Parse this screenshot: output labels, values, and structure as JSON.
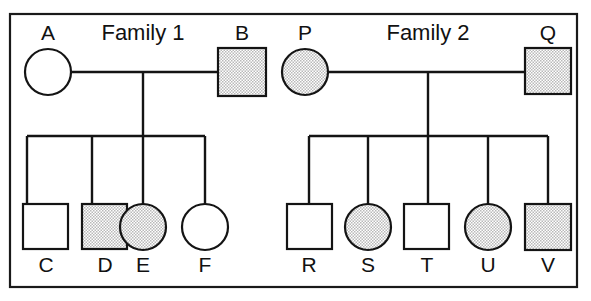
{
  "figure": {
    "name": "two-family-pedigree-chart",
    "width": 591,
    "height": 301,
    "background_color": "#ffffff",
    "line_color": "#141414",
    "affected_fill_color": "#d9d9d9",
    "unaffected_fill_color": "#ffffff",
    "frame": {
      "x": 9,
      "y": 13,
      "width": 569,
      "height": 275
    }
  },
  "legend_semantics": {
    "square": "male",
    "circle": "female",
    "shaded": "affected",
    "unshaded": "unaffected"
  },
  "families": [
    {
      "id": "family-1",
      "title": "Family 1",
      "title_x": 143,
      "title_y": 40,
      "mating_line": {
        "y": 72,
        "x1": 71,
        "x2": 218
      },
      "descent_line": {
        "x": 143,
        "y1": 72,
        "y2": 136
      },
      "sibship_line": {
        "y": 136,
        "x1": 27,
        "x2": 205
      },
      "parents": [
        {
          "label": "A",
          "shape": "circle",
          "affected": false,
          "sex": "female",
          "cx": 48,
          "cy": 72,
          "r": 23,
          "label_x": 48,
          "label_y": 40
        },
        {
          "label": "B",
          "shape": "square",
          "affected": true,
          "sex": "male",
          "x": 218,
          "y": 48,
          "size": 48,
          "label_x": 242,
          "label_y": 40
        }
      ],
      "children": [
        {
          "label": "C",
          "shape": "square",
          "affected": false,
          "sex": "male",
          "x": 23,
          "y": 204,
          "size": 45,
          "drop_x": 27,
          "label_x": 46,
          "label_y": 272
        },
        {
          "label": "D",
          "shape": "square",
          "affected": true,
          "sex": "male",
          "x": 82,
          "y": 204,
          "size": 45,
          "drop_x": 92,
          "label_x": 105,
          "label_y": 272
        },
        {
          "label": "E",
          "shape": "circle",
          "affected": true,
          "sex": "female",
          "cx": 143,
          "cy": 227,
          "r": 23,
          "drop_x": 143,
          "label_x": 143,
          "label_y": 272
        },
        {
          "label": "F",
          "shape": "circle",
          "affected": false,
          "sex": "female",
          "cx": 205,
          "cy": 227,
          "r": 23,
          "drop_x": 205,
          "label_x": 205,
          "label_y": 272
        }
      ]
    },
    {
      "id": "family-2",
      "title": "Family 2",
      "title_x": 428,
      "title_y": 40,
      "mating_line": {
        "y": 72,
        "x1": 328,
        "x2": 525
      },
      "descent_line": {
        "x": 428,
        "y1": 72,
        "y2": 136
      },
      "sibship_line": {
        "y": 136,
        "x1": 309,
        "x2": 548
      },
      "parents": [
        {
          "label": "P",
          "shape": "circle",
          "affected": true,
          "sex": "female",
          "cx": 305,
          "cy": 72,
          "r": 23,
          "label_x": 305,
          "label_y": 40
        },
        {
          "label": "Q",
          "shape": "square",
          "affected": true,
          "sex": "male",
          "x": 525,
          "y": 48,
          "size": 46,
          "label_x": 548,
          "label_y": 40
        }
      ],
      "children": [
        {
          "label": "R",
          "shape": "square",
          "affected": false,
          "sex": "male",
          "x": 287,
          "y": 204,
          "size": 45,
          "drop_x": 309,
          "label_x": 309,
          "label_y": 272
        },
        {
          "label": "S",
          "shape": "circle",
          "affected": true,
          "sex": "female",
          "cx": 368,
          "cy": 227,
          "r": 23,
          "drop_x": 368,
          "label_x": 368,
          "label_y": 272
        },
        {
          "label": "T",
          "shape": "square",
          "affected": false,
          "sex": "male",
          "x": 404,
          "y": 204,
          "size": 45,
          "drop_x": 428,
          "label_x": 427,
          "label_y": 272
        },
        {
          "label": "U",
          "shape": "circle",
          "affected": true,
          "sex": "female",
          "cx": 488,
          "cy": 227,
          "r": 23,
          "drop_x": 488,
          "label_x": 488,
          "label_y": 272
        },
        {
          "label": "V",
          "shape": "square",
          "affected": true,
          "sex": "male",
          "x": 525,
          "y": 204,
          "size": 46,
          "drop_x": 548,
          "label_x": 548,
          "label_y": 272
        }
      ]
    }
  ]
}
